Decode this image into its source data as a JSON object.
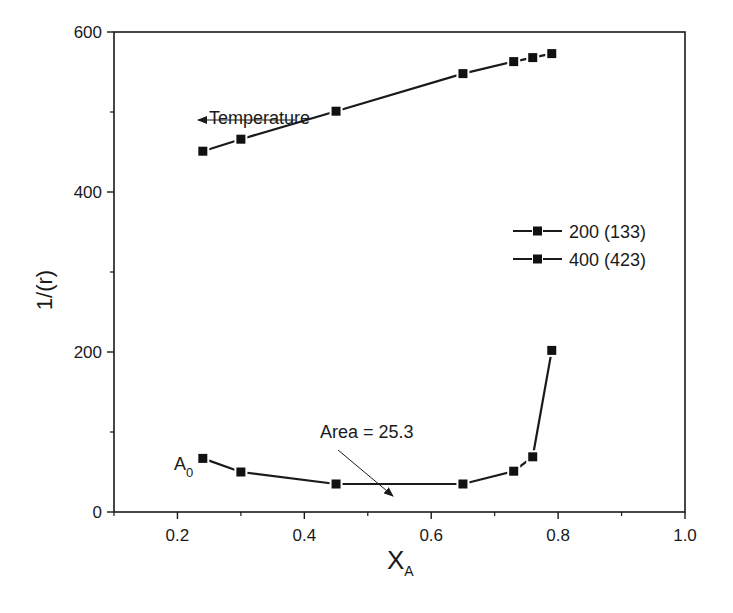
{
  "chart_data": {
    "type": "line",
    "title": "",
    "xlabel": "X",
    "xlabel_subscript": "A",
    "ylabel": "1/(r)",
    "xlim": [
      0.1,
      1.0
    ],
    "ylim": [
      0,
      600
    ],
    "x_ticks": [
      0.2,
      0.4,
      0.6,
      0.8,
      1.0
    ],
    "x_tick_labels": [
      "0.2",
      "0.4",
      "0.6",
      "0.8",
      "1.0"
    ],
    "y_ticks": [
      0,
      200,
      400,
      600
    ],
    "y_tick_labels": [
      "0",
      "200",
      "400",
      "600"
    ],
    "grid": false,
    "legend_position": "right-middle",
    "series": [
      {
        "name": "200 (133)",
        "marker": "square",
        "x": [
          0.24,
          0.3,
          0.45,
          0.65,
          0.73,
          0.76,
          0.79
        ],
        "values": [
          451,
          466,
          501,
          548,
          563,
          568,
          573
        ]
      },
      {
        "name": "400 (423)",
        "marker": "square",
        "x": [
          0.24,
          0.3,
          0.45,
          0.65,
          0.73,
          0.76,
          0.79
        ],
        "values": [
          67,
          50,
          35,
          35,
          51,
          69,
          202
        ]
      }
    ],
    "annotations": [
      {
        "text": "Temperature",
        "arrow": "left",
        "x": 0.38,
        "y": 490
      },
      {
        "text": "Area = 25.3",
        "arrow_to": [
          0.52,
          28
        ]
      },
      {
        "text": "A",
        "subscript": "0",
        "x": 0.22,
        "y": 60
      }
    ]
  }
}
